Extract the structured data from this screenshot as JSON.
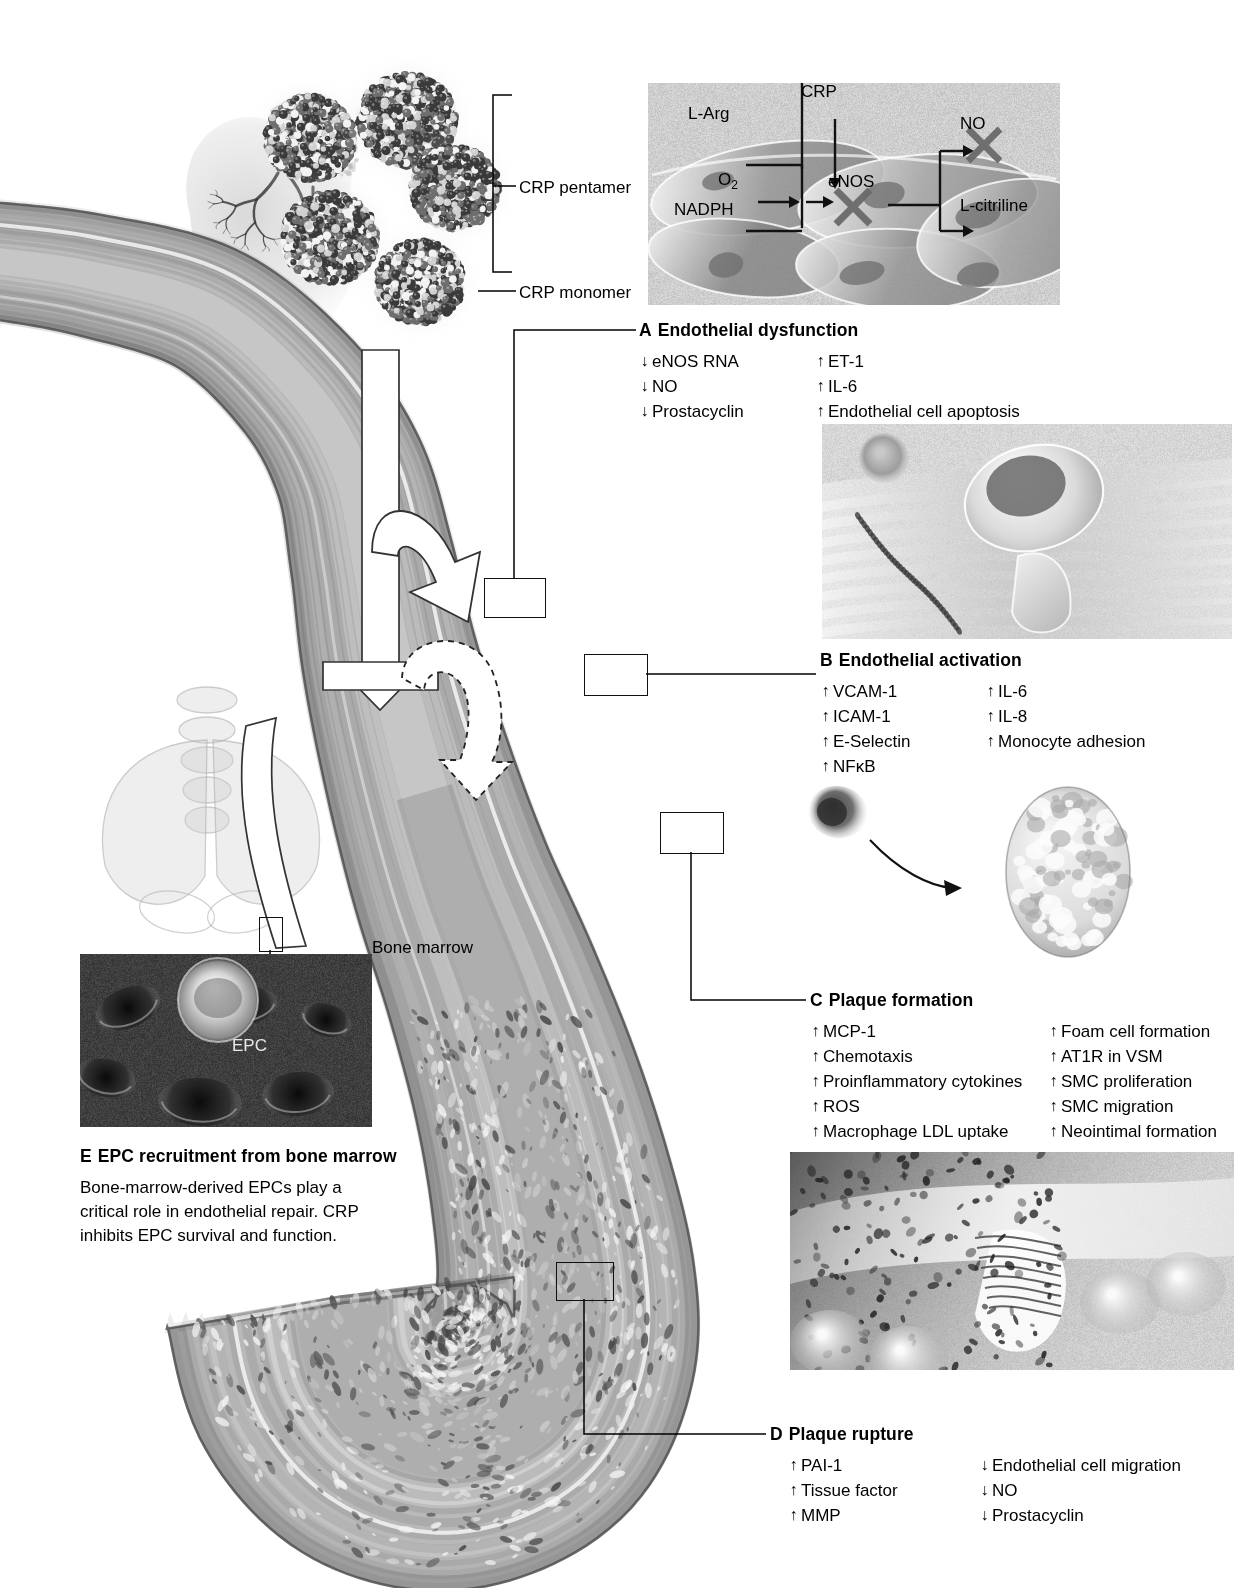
{
  "figure": {
    "crp_labels": {
      "pentamer": "CRP pentamer",
      "monomer": "CRP monomer"
    },
    "bone_marrow_label": "Bone marrow",
    "epc_label": "EPC"
  },
  "inset_enos": {
    "nodes": {
      "l_arg": "L-Arg",
      "nadph": "NADPH",
      "o2": "O2",
      "o2_sub": "2",
      "crp": "CRP",
      "enos": "eNOS",
      "no": "NO",
      "l_citriline": "L-citriline"
    },
    "blocked": [
      "eNOS",
      "NO"
    ]
  },
  "panels": [
    {
      "letter": "A",
      "title": "Endothelial dysfunction",
      "left_items": [
        {
          "dir": "down",
          "text": "eNOS RNA"
        },
        {
          "dir": "down",
          "text": "NO"
        },
        {
          "dir": "down",
          "text": "Prostacyclin"
        }
      ],
      "right_items": [
        {
          "dir": "up",
          "text": "ET-1"
        },
        {
          "dir": "up",
          "text": "IL-6"
        },
        {
          "dir": "up",
          "text": "Endothelial cell apoptosis"
        }
      ]
    },
    {
      "letter": "B",
      "title": "Endothelial activation",
      "left_items": [
        {
          "dir": "up",
          "text": "VCAM-1"
        },
        {
          "dir": "up",
          "text": "ICAM-1"
        },
        {
          "dir": "up",
          "text": "E-Selectin"
        },
        {
          "dir": "up",
          "text": "NFκB"
        }
      ],
      "right_items": [
        {
          "dir": "up",
          "text": "IL-6"
        },
        {
          "dir": "up",
          "text": "IL-8"
        },
        {
          "dir": "up",
          "text": "Monocyte adhesion"
        }
      ]
    },
    {
      "letter": "C",
      "title": "Plaque formation",
      "left_items": [
        {
          "dir": "up",
          "text": "MCP-1"
        },
        {
          "dir": "up",
          "text": "Chemotaxis"
        },
        {
          "dir": "up",
          "text": "Proinflammatory cytokines"
        },
        {
          "dir": "up",
          "text": "ROS"
        },
        {
          "dir": "up",
          "text": "Macrophage LDL uptake"
        }
      ],
      "right_items": [
        {
          "dir": "up",
          "text": "Foam cell formation"
        },
        {
          "dir": "up",
          "text": "AT1R in VSM"
        },
        {
          "dir": "up",
          "text": "SMC proliferation"
        },
        {
          "dir": "up",
          "text": "SMC migration"
        },
        {
          "dir": "up",
          "text": "Neointimal formation"
        }
      ]
    },
    {
      "letter": "D",
      "title": "Plaque rupture",
      "left_items": [
        {
          "dir": "up",
          "text": "PAI-1"
        },
        {
          "dir": "up",
          "text": "Tissue factor"
        },
        {
          "dir": "up",
          "text": "MMP"
        }
      ],
      "right_items": [
        {
          "dir": "down",
          "text": "Endothelial cell migration"
        },
        {
          "dir": "down",
          "text": "NO"
        },
        {
          "dir": "down",
          "text": "Prostacyclin"
        }
      ]
    },
    {
      "letter": "E",
      "title": "EPC recruitment from bone marrow",
      "body": "Bone-marrow-derived EPCs play a critical role in endothelial repair. CRP inhibits EPC survival and function."
    }
  ],
  "colors": {
    "ink": "#000000",
    "vessel_mid": "#9a9a9a",
    "vessel_dark": "#6e6e6e",
    "vessel_light": "#cfcfcf",
    "photo_bg": "#bdbdbd",
    "epc_bg": "#2f2f2f"
  }
}
